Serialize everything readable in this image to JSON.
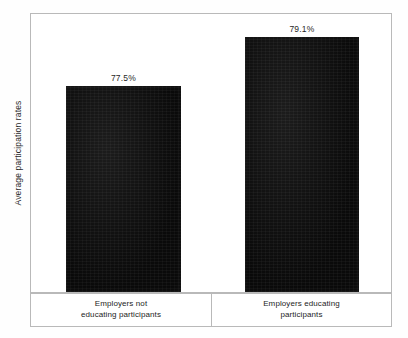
{
  "chart_data": {
    "type": "bar",
    "title": "",
    "subtitle": "",
    "xlabel": "",
    "ylabel": "Average participation rates",
    "categories": [
      "Employers not educating participants",
      "Employers educating participants"
    ],
    "category_lines": [
      [
        "Employers not",
        "educating participants"
      ],
      [
        "Employers educating",
        "participants"
      ]
    ],
    "values": [
      77.5,
      79.1
    ],
    "value_labels": [
      "77.5%",
      "79.1%"
    ],
    "ylim": [
      0,
      81.5
    ],
    "grid": false,
    "legend": "none",
    "axis_ticks": [],
    "bar_color": "#0d0d0d",
    "frame_color": "#b9b9b9",
    "background_color": "#ffffff"
  },
  "chart": {
    "y_axis_title": "Average participation rates",
    "bars": [
      {
        "label": "77.5%",
        "category_line1": "Employers not",
        "category_line2": "educating participants"
      },
      {
        "label": "79.1%",
        "category_line1": "Employers educating",
        "category_line2": "participants"
      }
    ]
  }
}
